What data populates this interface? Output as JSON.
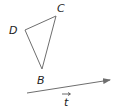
{
  "diagram": {
    "points": {
      "D": {
        "label": "D",
        "x": 25,
        "y": 30
      },
      "C": {
        "label": "C",
        "x": 56,
        "y": 16
      },
      "B": {
        "label": "B",
        "x": 42,
        "y": 69
      }
    },
    "vector": {
      "label": "t",
      "from": [
        27,
        93
      ],
      "to": [
        110,
        80
      ]
    },
    "colors": {
      "line": "#6e6e6e",
      "text": "#222222"
    }
  }
}
